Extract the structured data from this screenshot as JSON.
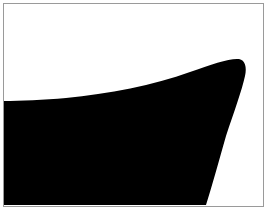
{
  "image": {
    "width": 268,
    "height": 213,
    "background_color": "#ffffff",
    "alt_text": "",
    "subject": "black silhouette of a ship bow / hull against a white field"
  },
  "frame": {
    "border_color": "#9a9a9a",
    "border_width_px": 1,
    "inset_px": 3,
    "fill_color": "#ffffff"
  },
  "figure": {
    "name": "bow-silhouette",
    "fill_color": "#000000",
    "path": "M 0,97 L 0,201 L 202,201 C 208,182 214,160 222,132 C 230,108 238,86 241,72 C 243,63 241,56 235,55 C 226,54 208,60 186,68 C 150,81 104,90 62,94 C 40,96 16,97 0,97 Z",
    "anchors": {
      "left_entry_y": 97,
      "tip_x": 241,
      "tip_y": 56,
      "bottom_edge_x": 202,
      "bottom_y": 201
    }
  },
  "palette": {
    "ink": "#000000",
    "paper": "#ffffff",
    "rule": "#9a9a9a"
  }
}
